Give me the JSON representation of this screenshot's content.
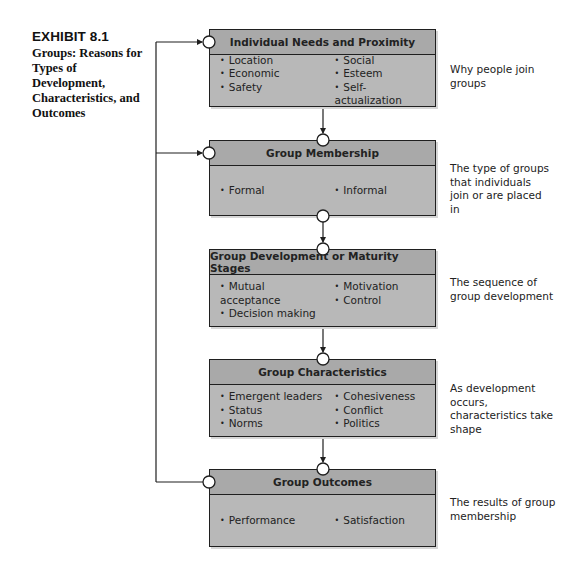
{
  "exhibit": {
    "number": "EXHIBIT 8.1",
    "title": "Groups: Reasons for Types of Development, Characteristics, and Outcomes"
  },
  "boxes": [
    {
      "title": "Individual Needs and Proximity",
      "left_items": [
        "Location",
        "Economic",
        "Safety"
      ],
      "right_items": [
        "Social",
        "Esteem",
        "Self-actualization"
      ],
      "note": "Why people join groups"
    },
    {
      "title": "Group Membership",
      "left_items": [
        "Formal"
      ],
      "right_items": [
        "Informal"
      ],
      "note": "The type of groups that individuals join or are placed in"
    },
    {
      "title": "Group Development or Maturity Stages",
      "left_items": [
        "Mutual acceptance",
        "Decision making"
      ],
      "right_items": [
        "Motivation",
        "Control"
      ],
      "note": "The sequence of group development"
    },
    {
      "title": "Group Characteristics",
      "left_items": [
        "Emergent leaders",
        "Status",
        "Norms"
      ],
      "right_items": [
        "Cohesiveness",
        "Conflict",
        "Politics"
      ],
      "note": "As development occurs, characteristics take shape"
    },
    {
      "title": "Group Outcomes",
      "left_items": [
        "Performance"
      ],
      "right_items": [
        "Satisfaction"
      ],
      "note": "The results of group membership"
    }
  ],
  "colors": {
    "box_fill": "#b8b8b8",
    "header_fill": "#a9a9a9",
    "line": "#1f1f1f"
  }
}
